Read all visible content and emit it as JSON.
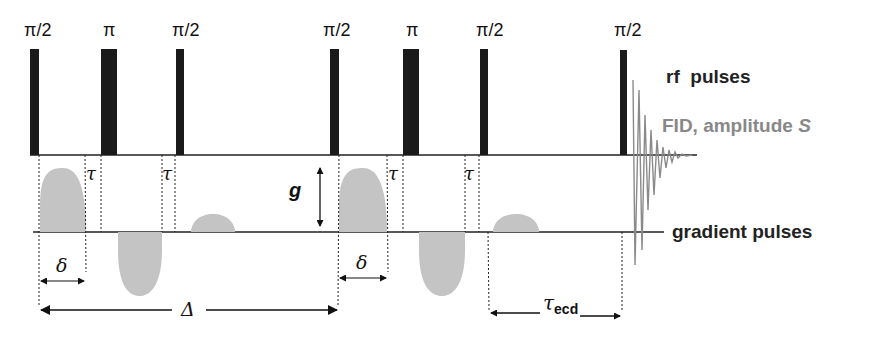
{
  "diagram": {
    "type": "pulse-sequence",
    "title": "",
    "rf_pulses": [
      {
        "label": "π/2",
        "x": 30,
        "width": 9
      },
      {
        "label": "π",
        "x": 101,
        "width": 16
      },
      {
        "label": "π/2",
        "x": 176,
        "width": 8
      },
      {
        "label": "π/2",
        "x": 330,
        "width": 9
      },
      {
        "label": "π",
        "x": 403,
        "width": 16
      },
      {
        "label": "π/2",
        "x": 480,
        "width": 8
      },
      {
        "label": "π/2",
        "x": 620,
        "width": 7
      }
    ],
    "legend": {
      "rf_label": "rf  pulses",
      "fid_label": "FID, amplitude ",
      "fid_symbol": "S",
      "gradient_label": "gradient pulses"
    },
    "annotations": {
      "tau": "τ",
      "delta_small": "δ",
      "delta_large": "Δ",
      "g": "g",
      "tau_ecd_main": "τ",
      "tau_ecd_sub": "ecd"
    },
    "colors": {
      "pulse": "#1a1a1a",
      "gradient": "#c4c4c4",
      "fid": "#8a8a8a",
      "line": "#222222",
      "fid_text": "#888888"
    }
  }
}
